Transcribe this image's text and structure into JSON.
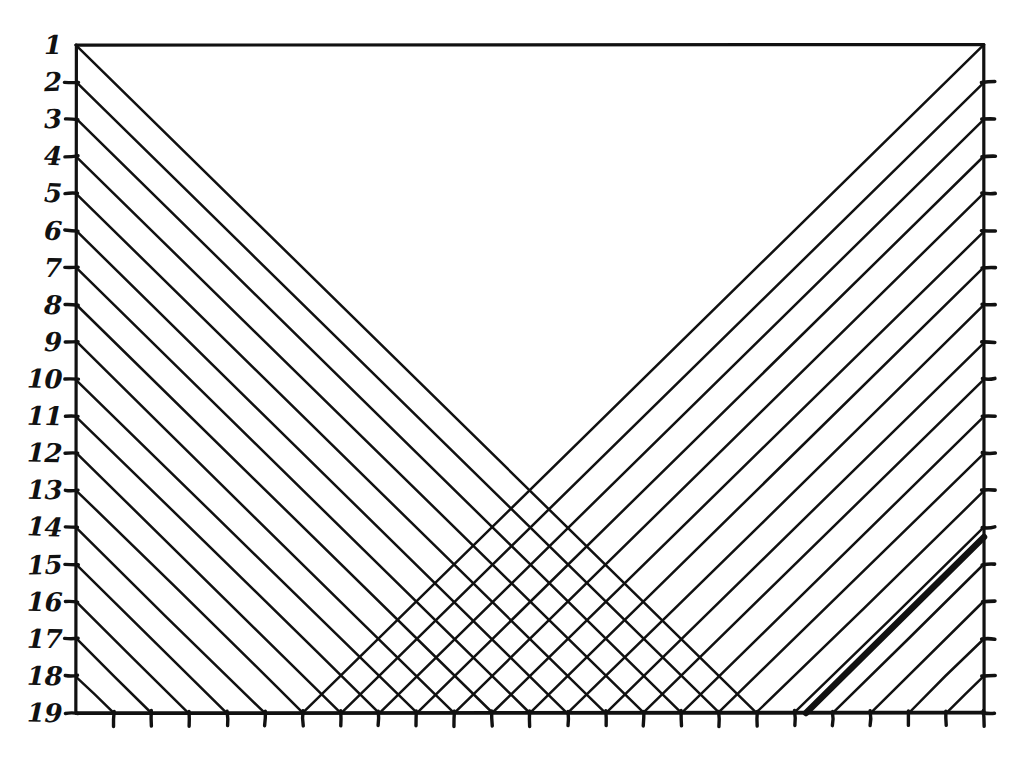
{
  "figure": {
    "kind": "hand-drawn-geometric-lattice",
    "caption": "",
    "background_color": "#ffffff",
    "ink_color": "#111111"
  },
  "frame": {
    "x0": 76,
    "y0": 45,
    "x1": 984,
    "y1": 713,
    "stroke_width": 3.2
  },
  "axes": {
    "left": {
      "name": "row-index-axis",
      "tick_count": 19,
      "labels": [
        "1",
        "2",
        "3",
        "4",
        "5",
        "6",
        "7",
        "8",
        "9",
        "10",
        "11",
        "12",
        "13",
        "14",
        "15",
        "16",
        "17",
        "18",
        "19"
      ],
      "tick_length": 11,
      "label_font_size": 26
    },
    "bottom": {
      "name": "column-tick-axis",
      "tick_count": 25,
      "labels": [],
      "tick_length": 13
    },
    "right": {
      "name": "right-tick-axis",
      "tick_count": 18,
      "labels": [],
      "tick_length": 11
    }
  },
  "chart_data": {
    "type": "line",
    "title": "",
    "subtitle": "",
    "xlabel": "",
    "ylabel": "",
    "grid": false,
    "legend": null,
    "xlim": [
      0,
      24
    ],
    "ylim": [
      19,
      1
    ],
    "series": [
      {
        "name": "descending-family",
        "direction": "down-right",
        "slope": 1,
        "count": 18,
        "start_rows": [
          1,
          2,
          3,
          4,
          5,
          6,
          7,
          8,
          9,
          10,
          11,
          12,
          13,
          14,
          15,
          16,
          17,
          18
        ],
        "note": "Each line begins on the left edge at its row and runs down-right at 45 degrees until it meets the bottom axis."
      },
      {
        "name": "ascending-family",
        "direction": "up-right",
        "slope": -1,
        "count": 18,
        "end_rows": [
          1,
          2,
          3,
          4,
          5,
          6,
          7,
          8,
          9,
          10,
          11,
          12,
          13,
          14,
          15,
          16,
          17,
          18
        ],
        "note": "Each line begins on the bottom axis and runs up-right at 45 degrees until it meets the right edge at its row."
      }
    ],
    "apex": {
      "x_px": 533,
      "y_px": 518,
      "note": "topmost crossing point of the two families"
    },
    "highlighted_line": {
      "name": "emphasized-trajectory",
      "direction": "up-right",
      "stroke_width": 6.5,
      "from_px": [
        806,
        713
      ],
      "to_px": [
        984,
        537
      ],
      "note": "one line drawn noticeably bolder than the rest in the lower-right region"
    }
  }
}
